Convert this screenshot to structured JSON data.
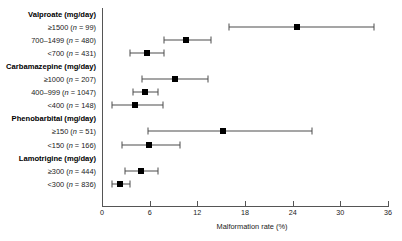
{
  "chart_data": {
    "type": "scatter",
    "title": "",
    "xlabel": "Malformation rate (%)",
    "ylabel": "",
    "xlim": [
      0,
      36
    ],
    "xticks": [
      0,
      6,
      12,
      18,
      24,
      30,
      36
    ],
    "xtick_labels": [
      "0",
      "6",
      "12",
      "18",
      "24",
      "30",
      "36"
    ],
    "grid": false,
    "legend": "none",
    "orientation": "horizontal-forest-plot",
    "groups": [
      {
        "label": "Valproate (mg/day)",
        "rows": [
          {
            "label": "≥1500 (n = 99)",
            "dose": "≥1500",
            "n": 99,
            "value": 24.5,
            "ci_low": 16.0,
            "ci_high": 34.3
          },
          {
            "label": "700–1499 (n = 480)",
            "dose": "700–1499",
            "n": 480,
            "value": 10.6,
            "ci_low": 7.8,
            "ci_high": 13.7
          },
          {
            "label": "<700 (n = 431)",
            "dose": "<700",
            "n": 431,
            "value": 5.7,
            "ci_low": 3.5,
            "ci_high": 7.8
          }
        ]
      },
      {
        "label": "Carbamazepine (mg/day)",
        "rows": [
          {
            "label": "≥1000 (n = 207)",
            "dose": "≥1000",
            "n": 207,
            "value": 9.2,
            "ci_low": 5.0,
            "ci_high": 13.4
          },
          {
            "label": "400–999 (n = 1047)",
            "dose": "400–999",
            "n": 1047,
            "value": 5.4,
            "ci_low": 3.9,
            "ci_high": 7.1
          },
          {
            "label": "<400 (n = 148)",
            "dose": "<400",
            "n": 148,
            "value": 4.2,
            "ci_low": 1.3,
            "ci_high": 7.7
          }
        ]
      },
      {
        "label": "Phenobarbital (mg/day)",
        "rows": [
          {
            "label": "≥150 (n = 51)",
            "dose": "≥150",
            "n": 51,
            "value": 15.2,
            "ci_low": 5.8,
            "ci_high": 26.4
          },
          {
            "label": "<150 (n = 166)",
            "dose": "<150",
            "n": 166,
            "value": 5.9,
            "ci_low": 2.5,
            "ci_high": 9.8
          }
        ]
      },
      {
        "label": "Lamotrigine (mg/day)",
        "rows": [
          {
            "label": "≥300 (n = 444)",
            "dose": "≥300",
            "n": 444,
            "value": 4.9,
            "ci_low": 2.9,
            "ci_high": 7.1
          },
          {
            "label": "<300 (n = 836)",
            "dose": "<300",
            "n": 836,
            "value": 2.3,
            "ci_low": 1.3,
            "ci_high": 3.5
          }
        ]
      }
    ],
    "colors": {
      "marker": "#000000",
      "ci_line": "#4d4d4d",
      "axis": "#555555",
      "text": "#1a1a1a",
      "background": "#ffffff"
    }
  }
}
